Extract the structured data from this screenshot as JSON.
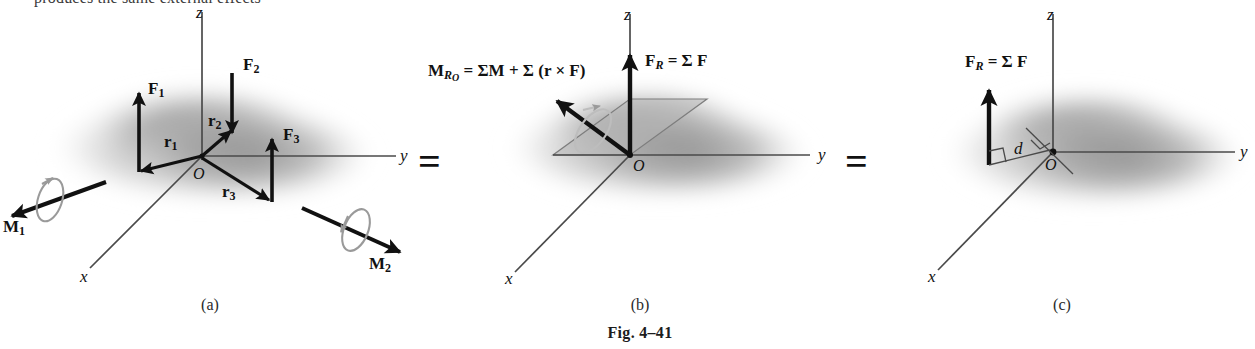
{
  "figure": {
    "caption": "Fig. 4–41",
    "clipped_header_text": "produces the same external effects",
    "equals_signs": [
      "=",
      "="
    ],
    "panel_captions": [
      "(a)",
      "(b)",
      "(c)"
    ]
  },
  "colors": {
    "vector_black": "#111111",
    "axis_gray": "#4a4a4a",
    "curl_gray": "#9a9a9a",
    "blob_gray": "#9d9d9d",
    "plane_gray": "#b3b3b3",
    "background": "#ffffff"
  },
  "panel_a": {
    "caption": "(a)",
    "axes": {
      "x": "x",
      "y": "y",
      "z": "z"
    },
    "origin": "O",
    "forces": [
      {
        "name": "F1",
        "label_main": "F",
        "label_sub": "1",
        "direction": "up"
      },
      {
        "name": "F2",
        "label_main": "F",
        "label_sub": "2",
        "direction": "down"
      },
      {
        "name": "F3",
        "label_main": "F",
        "label_sub": "3",
        "direction": "up"
      }
    ],
    "position_vectors": [
      {
        "name": "r1",
        "label_main": "r",
        "label_sub": "1"
      },
      {
        "name": "r2",
        "label_main": "r",
        "label_sub": "2"
      },
      {
        "name": "r3",
        "label_main": "r",
        "label_sub": "3"
      }
    ],
    "couple_moments": [
      {
        "name": "M1",
        "label_main": "M",
        "label_sub": "1",
        "direction": "down-left"
      },
      {
        "name": "M2",
        "label_main": "M",
        "label_sub": "2",
        "direction": "down-right"
      }
    ]
  },
  "panel_b": {
    "caption": "(b)",
    "axes": {
      "x": "x",
      "y": "y",
      "z": "z"
    },
    "origin": "O",
    "resultant_force": {
      "name": "FR",
      "equation_parts": [
        "F",
        "R",
        " = ",
        "Σ",
        " F"
      ],
      "equation_plain": "F_R = Σ F"
    },
    "resultant_moment": {
      "name": "MRO",
      "equation_parts": [
        "M",
        "R",
        "O",
        " = ",
        "Σ",
        "M",
        " + ",
        "Σ",
        " (",
        "r",
        " × ",
        "F",
        ")"
      ],
      "equation_plain": "M_{R_O} = ΣM + Σ (r × F)"
    }
  },
  "panel_c": {
    "caption": "(c)",
    "axes": {
      "x": "x",
      "y": "y",
      "z": "z"
    },
    "origin": "O",
    "resultant_force": {
      "name": "FR",
      "equation_plain": "F_R = Σ F"
    },
    "distance_label": "d"
  }
}
